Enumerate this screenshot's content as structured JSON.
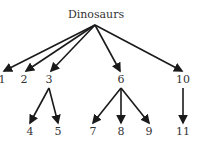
{
  "diagram": {
    "title": "Dinosaurs",
    "root": {
      "label": "Dinosaurs",
      "x": 96,
      "y": 18
    },
    "apex": {
      "x": 95,
      "y": 25
    },
    "level1": [
      {
        "id": "n1",
        "label": "1",
        "x": 2,
        "y": 83
      },
      {
        "id": "n2",
        "label": "2",
        "x": 24,
        "y": 83
      },
      {
        "id": "n3",
        "label": "3",
        "x": 49,
        "y": 83
      },
      {
        "id": "n6",
        "label": "6",
        "x": 121,
        "y": 83
      },
      {
        "id": "n10",
        "label": "10",
        "x": 183,
        "y": 83
      }
    ],
    "level2": [
      {
        "id": "n4",
        "label": "4",
        "x": 30,
        "y": 135,
        "parent": "n3"
      },
      {
        "id": "n5",
        "label": "5",
        "x": 58,
        "y": 135,
        "parent": "n3"
      },
      {
        "id": "n7",
        "label": "7",
        "x": 93,
        "y": 135,
        "parent": "n6"
      },
      {
        "id": "n8",
        "label": "8",
        "x": 121,
        "y": 135,
        "parent": "n6"
      },
      {
        "id": "n9",
        "label": "9",
        "x": 149,
        "y": 135,
        "parent": "n6"
      },
      {
        "id": "n11",
        "label": "11",
        "x": 183,
        "y": 135,
        "parent": "n10"
      }
    ]
  }
}
